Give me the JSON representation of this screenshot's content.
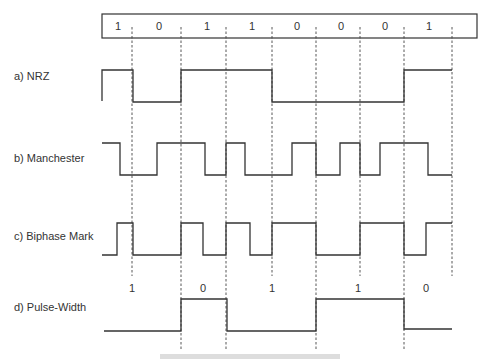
{
  "diagram": {
    "bit_sequence": [
      "1",
      "0",
      "1",
      "1",
      "0",
      "0",
      "0",
      "1"
    ],
    "rows": [
      {
        "label": "a)  NRZ",
        "name": "nrz"
      },
      {
        "label": "b) Manchester",
        "name": "manchester"
      },
      {
        "label": "c) Biphase Mark",
        "name": "biphase-mark"
      },
      {
        "label": "d) Pulse-Width",
        "name": "pulse-width"
      }
    ],
    "pulse_width_bits": [
      "1",
      "0",
      "1",
      "1",
      "0"
    ]
  }
}
